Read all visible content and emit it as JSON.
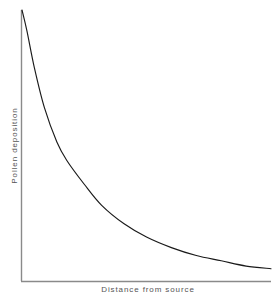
{
  "chart_data": {
    "type": "line",
    "title": "",
    "subtitle": "",
    "xlabel": "Distance from source",
    "ylabel": "Pollen deposition",
    "grid": false,
    "legend": null,
    "axis_style": "open-L (left spine and bottom spine only)",
    "xlim": [
      0,
      1
    ],
    "ylim": [
      0,
      1
    ],
    "xticks": [],
    "yticks": [],
    "annotations": [],
    "series": [
      {
        "name": "Pollen deposition vs distance",
        "color": "#1a1a1a",
        "x": [
          0.0,
          0.02,
          0.05,
          0.09,
          0.14,
          0.18,
          0.25,
          0.32,
          0.41,
          0.5,
          0.6,
          0.7,
          0.8,
          0.9,
          1.0
        ],
        "y": [
          1.0,
          0.92,
          0.78,
          0.63,
          0.5,
          0.43,
          0.34,
          0.26,
          0.19,
          0.14,
          0.1,
          0.07,
          0.05,
          0.03,
          0.02
        ]
      }
    ]
  },
  "colors": {
    "background": "#ffffff",
    "curve": "#1a1a1a",
    "axis": "#888888",
    "label_text": "#555555"
  },
  "axes": {
    "x_label": "Distance from source",
    "y_label": "Pollen deposition"
  }
}
